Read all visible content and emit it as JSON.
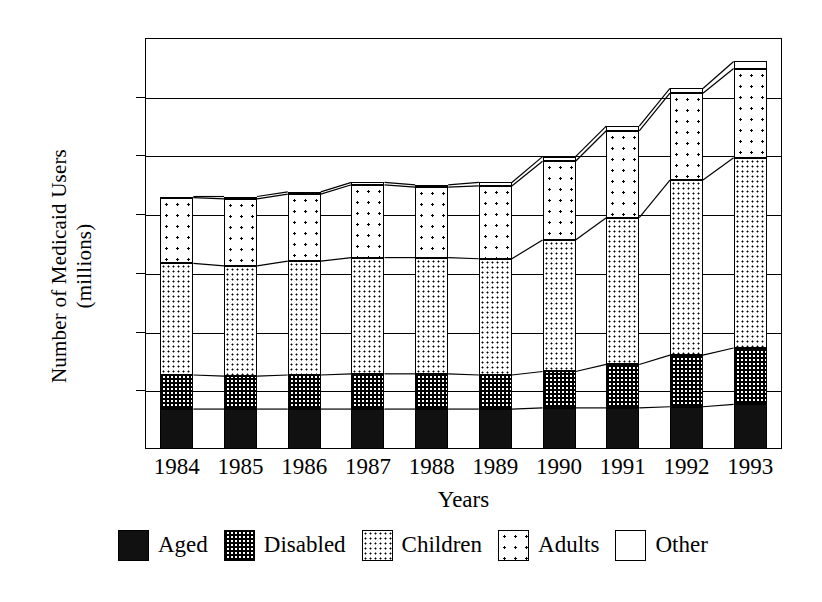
{
  "chart_data": {
    "type": "bar",
    "subtype": "stacked-bar-with-connector-lines",
    "title": "",
    "xlabel": "Years",
    "ylabel": "Number of Medicaid Users\n(millions)",
    "ylabel_lines": [
      "Number of Medicaid Users",
      "(millions)"
    ],
    "categories": [
      "1984",
      "1985",
      "1986",
      "1987",
      "1988",
      "1989",
      "1990",
      "1991",
      "1992",
      "1993"
    ],
    "ylim": [
      0,
      35
    ],
    "yticks": [
      0,
      5,
      10,
      15,
      20,
      25,
      30,
      35
    ],
    "ytick_labels": [
      "0",
      "5",
      "10",
      "15",
      "20",
      "25",
      "30",
      "35"
    ],
    "grid": "horizontal",
    "legend_position": "bottom",
    "series": [
      {
        "name": "Aged",
        "pattern": "solid-black",
        "values": [
          3.4,
          3.4,
          3.4,
          3.4,
          3.4,
          3.4,
          3.5,
          3.5,
          3.6,
          3.8
        ]
      },
      {
        "name": "Disabled",
        "pattern": "checkerboard",
        "values": [
          2.9,
          2.8,
          2.9,
          3.0,
          3.0,
          2.9,
          3.1,
          3.7,
          4.4,
          4.8
        ]
      },
      {
        "name": "Children",
        "pattern": "dense-dots",
        "values": [
          9.5,
          9.4,
          9.7,
          9.9,
          9.9,
          9.9,
          11.2,
          12.5,
          14.9,
          16.2
        ]
      },
      {
        "name": "Adults",
        "pattern": "sparse-dots",
        "values": [
          5.6,
          5.7,
          5.7,
          6.2,
          6.0,
          6.2,
          6.7,
          7.4,
          7.4,
          7.6
        ]
      },
      {
        "name": "Other",
        "pattern": "white-empty",
        "values": [
          0.1,
          0.2,
          0.2,
          0.2,
          0.2,
          0.3,
          0.4,
          0.4,
          0.4,
          0.6
        ]
      }
    ],
    "totals": [
      21.5,
      21.5,
      21.9,
      22.7,
      22.5,
      22.7,
      24.9,
      27.5,
      30.7,
      33.0
    ],
    "cumulative_tops": {
      "aged": [
        3.4,
        3.4,
        3.4,
        3.4,
        3.4,
        3.4,
        3.5,
        3.5,
        3.6,
        3.8
      ],
      "disabled": [
        6.3,
        6.2,
        6.3,
        6.4,
        6.4,
        6.3,
        6.6,
        7.2,
        8.0,
        8.6
      ],
      "children": [
        15.8,
        15.6,
        16.0,
        16.3,
        16.3,
        16.2,
        17.8,
        19.7,
        22.9,
        24.8
      ],
      "adults": [
        21.4,
        21.3,
        21.7,
        22.5,
        22.3,
        22.4,
        24.5,
        27.1,
        30.3,
        32.4
      ],
      "other": [
        21.5,
        21.5,
        21.9,
        22.7,
        22.5,
        22.7,
        24.9,
        27.5,
        30.7,
        33.0
      ]
    }
  },
  "axis": {
    "y_title_line1": "Number of Medicaid Users",
    "y_title_line2": "(millions)",
    "x_title": "Years"
  },
  "legend": {
    "items": [
      {
        "label": "Aged",
        "swatch": "solid-black-swatch"
      },
      {
        "label": "Disabled",
        "swatch": "checkerboard-swatch"
      },
      {
        "label": "Children",
        "swatch": "dense-dots-swatch"
      },
      {
        "label": "Adults",
        "swatch": "sparse-dots-swatch"
      },
      {
        "label": "Other",
        "swatch": "white-empty-swatch"
      }
    ]
  },
  "colors": {
    "ink": "#000000",
    "background": "#ffffff"
  }
}
